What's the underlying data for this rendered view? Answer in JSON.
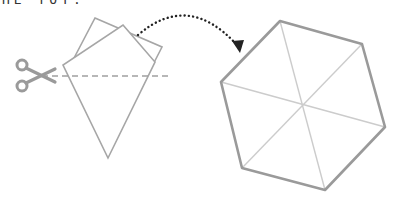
{
  "caption": {
    "text": "HE TOY."
  },
  "colors": {
    "outline": "#a6a6a6",
    "hex_outline": "#9a9a9a",
    "hex_inner": "#cccccc",
    "dashed": "#a0a0a0",
    "scissors": "#9a9a9a",
    "arrow": "#222222"
  },
  "diagram": {
    "back_square": [
      [
        95,
        18
      ],
      [
        162,
        47
      ],
      [
        140,
        90
      ],
      [
        73,
        60
      ]
    ],
    "kite": [
      [
        123,
        25
      ],
      [
        155,
        62
      ],
      [
        108,
        158
      ],
      [
        63,
        65
      ]
    ],
    "cut_line": {
      "x1": 42,
      "y1": 76,
      "x2": 170,
      "y2": 76
    },
    "arrow_path": "M138,35 Q188,-8 238,48",
    "hexagon": [
      [
        280,
        21
      ],
      [
        362,
        44
      ],
      [
        385,
        127
      ],
      [
        325,
        190
      ],
      [
        242,
        168
      ],
      [
        221,
        82
      ]
    ],
    "hex_center": [
      303,
      106
    ]
  },
  "icons": {
    "scissors": "scissors-icon",
    "arrow": "dotted-arrow"
  }
}
